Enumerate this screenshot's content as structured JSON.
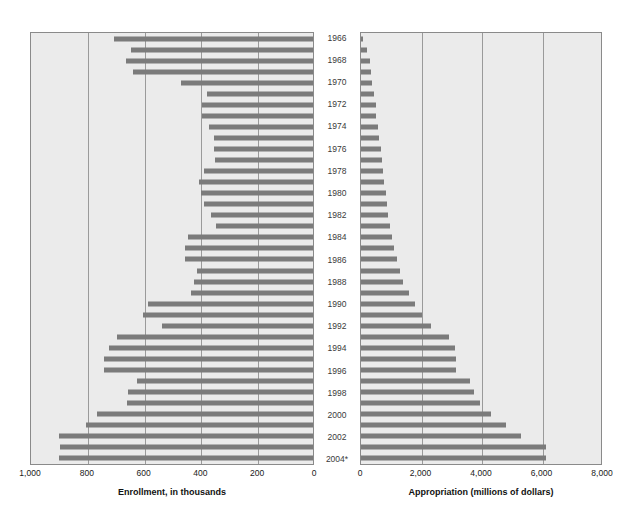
{
  "chart_data": {
    "type": "bar",
    "title": "",
    "orientation": "horizontal",
    "layout": "back-to-back paired horizontal bar charts sharing a common year axis in the center",
    "grid": true,
    "legend": null,
    "categories": [
      "1966",
      "1967",
      "1968",
      "1969",
      "1970",
      "1971",
      "1972",
      "1973",
      "1974",
      "1975",
      "1976",
      "1977",
      "1978",
      "1979",
      "1980",
      "1981",
      "1982",
      "1983",
      "1984",
      "1985",
      "1986",
      "1987",
      "1988",
      "1989",
      "1990",
      "1991",
      "1992",
      "1993",
      "1994",
      "1995",
      "1996",
      "1997",
      "1998",
      "1999",
      "2000",
      "2001",
      "2002",
      "2003",
      "2004*"
    ],
    "category_labels_shown": [
      "1966",
      "1968",
      "1970",
      "1972",
      "1974",
      "1976",
      "1978",
      "1980",
      "1982",
      "1984",
      "1986",
      "1988",
      "1990",
      "1992",
      "1994",
      "1996",
      "1998",
      "2000",
      "2002",
      "2004*"
    ],
    "panels": [
      {
        "name": "enrollment",
        "position": "left",
        "xlabel": "Enrollment, in thousands",
        "direction": "right-to-left",
        "xlim": [
          0,
          1000
        ],
        "xticks": [
          1000,
          800,
          600,
          400,
          200,
          0
        ],
        "xtick_labels": [
          "1,000",
          "800",
          "600",
          "400",
          "200",
          "0"
        ],
        "series": [
          {
            "name": "Enrollment, in thousands",
            "values": [
              700,
              640,
              660,
              635,
              465,
              375,
              390,
              390,
              365,
              350,
              350,
              345,
              385,
              400,
              395,
              385,
              360,
              340,
              440,
              450,
              450,
              410,
              420,
              430,
              580,
              600,
              530,
              690,
              720,
              735,
              735,
              620,
              650,
              655,
              760,
              800,
              895,
              890,
              895
            ]
          }
        ]
      },
      {
        "name": "appropriation",
        "position": "right",
        "xlabel": "Appropriation (millions of dollars)",
        "direction": "left-to-right",
        "xlim": [
          0,
          8000
        ],
        "xticks": [
          0,
          2000,
          4000,
          6000,
          8000
        ],
        "xtick_labels": [
          "0",
          "2,000",
          "4,000",
          "6,000",
          "8,000"
        ],
        "series": [
          {
            "name": "Appropriation (millions of dollars)",
            "values": [
              60,
              200,
              300,
              330,
              370,
              420,
              480,
              500,
              550,
              580,
              650,
              680,
              720,
              760,
              820,
              850,
              900,
              960,
              1030,
              1100,
              1180,
              1300,
              1400,
              1600,
              1800,
              2000,
              2300,
              2900,
              3100,
              3150,
              3150,
              3600,
              3750,
              3950,
              4300,
              4800,
              5300,
              6100,
              6100,
              6800
            ]
          }
        ]
      }
    ]
  },
  "colors": {
    "bar": "#7b7b7b",
    "panel_background": "#ebebeb",
    "panel_border": "#8a8a8a",
    "gridline": "#9a9a9a",
    "text": "#1a1a1a",
    "year_text": "#3a3a3a"
  }
}
